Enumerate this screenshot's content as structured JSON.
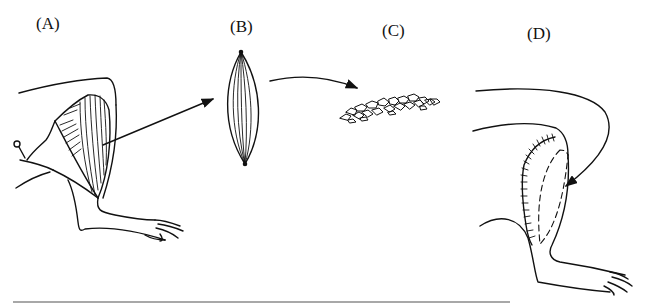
{
  "figure": {
    "panels": [
      {
        "id": "A",
        "label": "(A)",
        "description": "Limb with muscle exposed and excised; pin holding skin flap"
      },
      {
        "id": "B",
        "label": "(B)",
        "description": "Isolated fusiform muscle"
      },
      {
        "id": "C",
        "label": "(C)",
        "description": "Minced muscle fragments"
      },
      {
        "id": "D",
        "label": "(D)",
        "description": "Minced muscle implanted back into limb bed; sutured incision"
      }
    ],
    "colors": {
      "line": "#111111",
      "rule": "#a8a8a8",
      "background": "#ffffff"
    }
  }
}
